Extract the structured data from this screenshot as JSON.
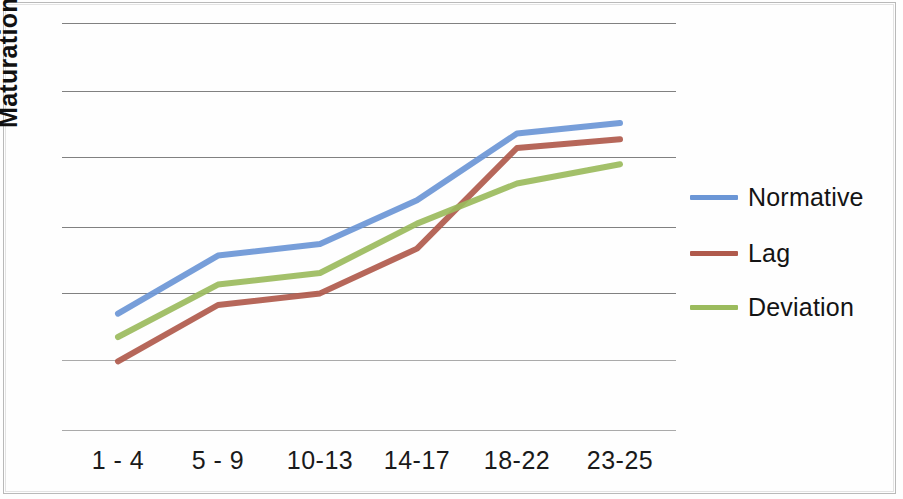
{
  "chart_data": {
    "type": "line",
    "title": "",
    "xlabel": "",
    "ylabel": "Maturation",
    "categories": [
      "1 - 4",
      "5 - 9",
      "10-13",
      "14-17",
      "18-22",
      "23-25"
    ],
    "grid": true,
    "gridlines": 7,
    "legend_position": "right",
    "ylim": [
      0,
      7
    ],
    "yticks_labeled": false,
    "series": [
      {
        "name": "Normative",
        "color": "#6b96d6",
        "values": [
          2.0,
          3.0,
          3.2,
          3.95,
          5.1,
          5.28
        ]
      },
      {
        "name": "Lag",
        "color": "#b05a4c",
        "values": [
          1.18,
          2.15,
          2.35,
          3.12,
          4.85,
          5.0
        ]
      },
      {
        "name": "Deviation",
        "color": "#9bbb5d",
        "values": [
          1.6,
          2.5,
          2.7,
          3.55,
          4.24,
          4.57
        ]
      }
    ]
  },
  "legend": {
    "items": [
      {
        "label": "Normative",
        "color": "#6b96d6"
      },
      {
        "label": "Lag",
        "color": "#b05a4c"
      },
      {
        "label": "Deviation",
        "color": "#9bbb5d"
      }
    ]
  },
  "axis": {
    "y_title": "Maturation"
  },
  "colors": {
    "normative": "#6b96d6",
    "lag": "#b05a4c",
    "deviation": "#9bbb5d",
    "gridline": "#6b6b6b",
    "frame": "#b9b9b9",
    "text": "#111111"
  }
}
